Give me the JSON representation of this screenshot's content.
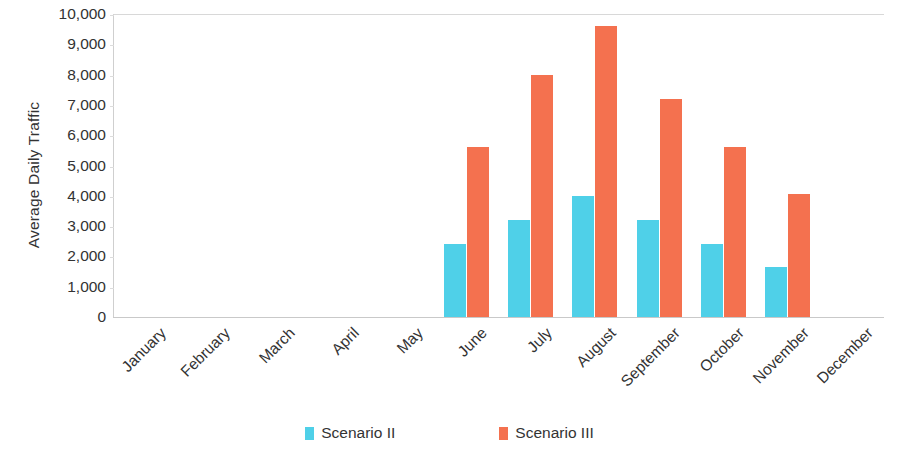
{
  "chart_data": {
    "type": "bar",
    "title": "",
    "xlabel": "",
    "ylabel": "Average Daily Traffic",
    "ylim": [
      0,
      10000
    ],
    "ytick_step": 1000,
    "grid": false,
    "legend_position": "bottom-center",
    "categories": [
      "January",
      "February",
      "March",
      "April",
      "May",
      "June",
      "July",
      "August",
      "September",
      "October",
      "November",
      "December"
    ],
    "ytick_labels": [
      "10,000",
      "9,000",
      "8,000",
      "7,000",
      "6,000",
      "5,000",
      "4,000",
      "3,000",
      "2,000",
      "1,000",
      "0"
    ],
    "ytick_values": [
      10000,
      9000,
      8000,
      7000,
      6000,
      5000,
      4000,
      3000,
      2000,
      1000,
      0
    ],
    "series": [
      {
        "name": "Scenario II",
        "color": "#4fd0e8",
        "values": [
          0,
          0,
          0,
          0,
          0,
          2400,
          3200,
          4000,
          3200,
          2400,
          1650,
          0
        ]
      },
      {
        "name": "Scenario III",
        "color": "#f4714f",
        "values": [
          0,
          0,
          0,
          0,
          0,
          5600,
          8000,
          9600,
          7200,
          5600,
          4050,
          0
        ]
      }
    ]
  },
  "legend": {
    "items": [
      {
        "label": "Scenario II",
        "color": "#4fd0e8"
      },
      {
        "label": "Scenario III",
        "color": "#f4714f"
      }
    ]
  }
}
